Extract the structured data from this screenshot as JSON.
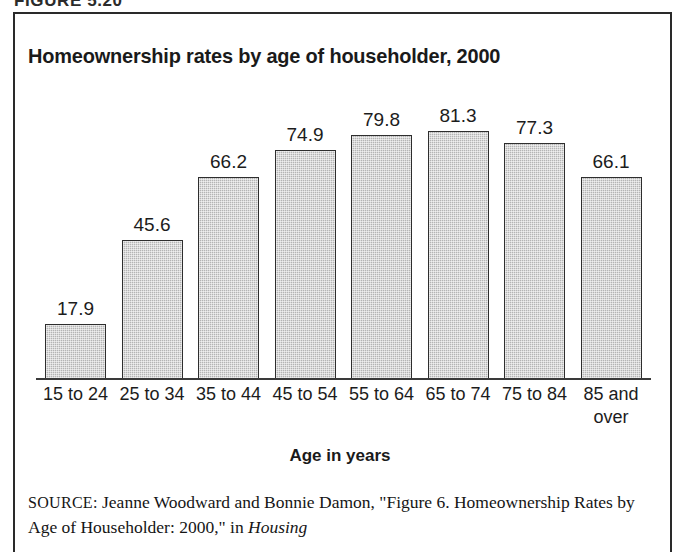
{
  "figure": {
    "caption": "FIGURE 5.20"
  },
  "chart": {
    "title": "Homeownership rates by age of householder, 2000",
    "axis_title": "Age in years"
  },
  "source": {
    "label": "SOURCE:",
    "text_before_italic": " Jeanne Woodward and Bonnie Damon, \"Figure 6. Homeownership Rates by Age of Householder: 2000,\" in ",
    "italic_text": "Housing"
  },
  "chart_data": {
    "type": "bar",
    "title": "Homeownership rates by age of householder, 2000",
    "xlabel": "Age in years",
    "ylabel": "",
    "ylim": [
      0,
      90
    ],
    "grid": false,
    "legend": "none",
    "categories": [
      "15 to 24",
      "25 to 34",
      "35 to 44",
      "45 to 54",
      "55 to 64",
      "65 to 74",
      "75 to 84",
      "85 and over"
    ],
    "values": [
      17.9,
      45.6,
      66.2,
      74.9,
      79.8,
      81.3,
      77.3,
      66.1
    ],
    "value_labels": [
      "17.9",
      "45.6",
      "66.2",
      "74.9",
      "79.8",
      "81.3",
      "77.3",
      "66.1"
    ],
    "bar_fill_color": "#b4b4b4",
    "bar_border_color": "#2e2e2e"
  }
}
